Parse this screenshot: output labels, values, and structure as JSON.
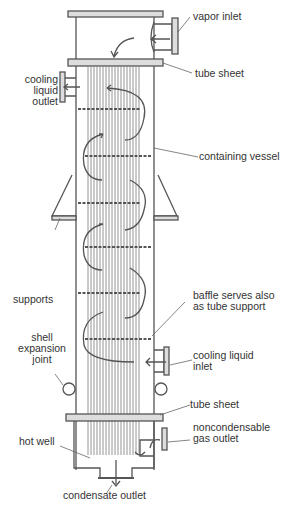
{
  "diagram": {
    "labels": {
      "vapor_inlet": "vapor inlet",
      "tube_sheet_top": "tube sheet",
      "cooling_outlet_1": "cooling",
      "cooling_outlet_2": "liquid",
      "cooling_outlet_3": "outlet",
      "containing_vessel": "containing vessel",
      "supports": "supports",
      "baffle_1": "baffle serves also",
      "baffle_2": "as tube support",
      "shell_1": "shell",
      "shell_2": "expansion",
      "shell_3": "joint",
      "cooling_inlet_1": "cooling liquid",
      "cooling_inlet_2": "inlet",
      "tube_sheet_bottom": "tube sheet",
      "hot_well": "hot well",
      "noncond_1": "noncondensable",
      "noncond_2": "gas outlet",
      "condensate_outlet": "condensate outlet"
    },
    "colors": {
      "line": "#555555",
      "tubes": "#888888",
      "text": "#333333"
    }
  }
}
